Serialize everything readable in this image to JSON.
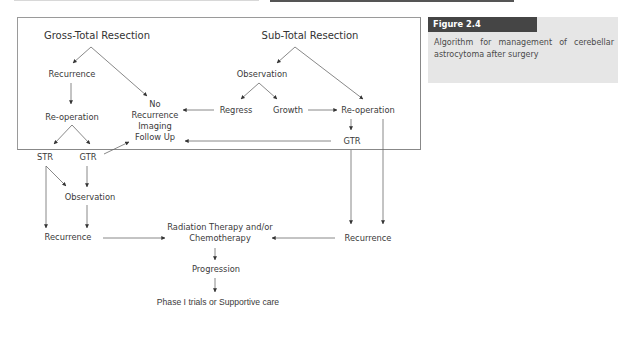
{
  "figure": {
    "label": "Figure 2.4",
    "caption": "Algorithm for management of cerebellar astrocytoma after surgery",
    "colors": {
      "tab_bg": "#454545",
      "caption_bg": "#e6e6e6",
      "line": "#666666",
      "text": "#3a3a3a"
    }
  },
  "diagram": {
    "nodes": {
      "gtr_root": "Gross-Total Resection",
      "str_root": "Sub-Total Resection",
      "recurrence_left": "Recurrence",
      "reoperation_left": "Re-operation",
      "str_left": "STR",
      "gtr_left": "GTR",
      "observation_left": "Observation",
      "recurrence_left_bottom": "Recurrence",
      "no_recurrence": "No Recurrence Imaging Follow Up",
      "observation_right": "Observation",
      "regress": "Regress",
      "growth": "Growth",
      "reoperation_right": "Re-operation",
      "gtr_right": "GTR",
      "recurrence_right": "Recurrence",
      "radiation": "Radiation Therapy and/or Chemotherapy",
      "progression": "Progression",
      "phase1": "Phase I trials or Supportive care"
    },
    "edges": [
      [
        "Gross-Total Resection",
        "Recurrence"
      ],
      [
        "Gross-Total Resection",
        "No Recurrence Imaging Follow Up"
      ],
      [
        "Recurrence",
        "Re-operation"
      ],
      [
        "Re-operation",
        "STR"
      ],
      [
        "Re-operation",
        "GTR"
      ],
      [
        "GTR",
        "No Recurrence Imaging Follow Up"
      ],
      [
        "STR",
        "Observation"
      ],
      [
        "GTR",
        "Observation"
      ],
      [
        "STR",
        "Recurrence"
      ],
      [
        "Observation",
        "Recurrence"
      ],
      [
        "Recurrence",
        "Radiation Therapy and/or Chemotherapy"
      ],
      [
        "Sub-Total Resection",
        "Observation"
      ],
      [
        "Sub-Total Resection",
        "Re-operation"
      ],
      [
        "Observation",
        "Regress"
      ],
      [
        "Observation",
        "Growth"
      ],
      [
        "Regress",
        "No Recurrence Imaging Follow Up"
      ],
      [
        "Growth",
        "Re-operation"
      ],
      [
        "Re-operation",
        "GTR"
      ],
      [
        "GTR",
        "No Recurrence Imaging Follow Up"
      ],
      [
        "GTR",
        "Recurrence"
      ],
      [
        "Re-operation",
        "Recurrence"
      ],
      [
        "Recurrence",
        "Radiation Therapy and/or Chemotherapy"
      ],
      [
        "Radiation Therapy and/or Chemotherapy",
        "Progression"
      ],
      [
        "Progression",
        "Phase I trials or Supportive care"
      ]
    ]
  }
}
